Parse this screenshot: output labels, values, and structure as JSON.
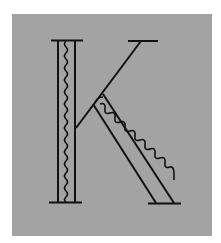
{
  "figure": {
    "letter": "K",
    "colors": {
      "background": "#ffffff",
      "panel": "#a3a3a3",
      "stroke": "#111111"
    }
  }
}
